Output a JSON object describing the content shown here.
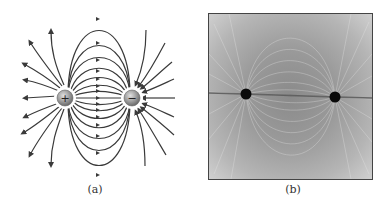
{
  "figure": {
    "panels": [
      {
        "id": "a",
        "caption": "(a)",
        "type": "field-line-diagram",
        "charges": [
          {
            "sign": "+",
            "label": "+"
          },
          {
            "sign": "-",
            "label": "−"
          }
        ]
      },
      {
        "id": "b",
        "caption": "(b)",
        "type": "photograph",
        "description": "grass seeds aligned in electric field of two charged electrodes"
      }
    ],
    "colors": {
      "line": "#3a3a3a",
      "charge_fill": "#9a9a9a",
      "photo_bg": "#9a9a9a",
      "electrode": "#0a0a0a"
    }
  }
}
